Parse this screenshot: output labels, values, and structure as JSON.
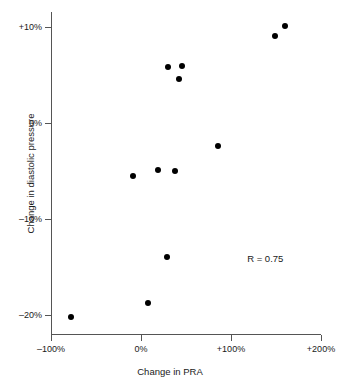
{
  "chart_data": {
    "type": "scatter",
    "title": "",
    "xlabel": "Change in PRA",
    "ylabel": "Change in diastolic pressure",
    "xlim": [
      -100,
      200
    ],
    "ylim": [
      -22.5,
      11.5
    ],
    "grid": false,
    "legend": "none",
    "xticks": [
      {
        "value": -100,
        "label": "–100%"
      },
      {
        "value": 0,
        "label": "0%"
      },
      {
        "value": 100,
        "label": "+100%"
      },
      {
        "value": 200,
        "label": "+200%"
      }
    ],
    "yticks": [
      {
        "value": 10,
        "label": "+10%"
      },
      {
        "value": 0,
        "label": "0%"
      },
      {
        "value": -10,
        "label": "–10%"
      },
      {
        "value": -20,
        "label": "–20%"
      }
    ],
    "points": [
      {
        "x": 160,
        "y": 10.1
      },
      {
        "x": 149,
        "y": 9.1
      },
      {
        "x": 30,
        "y": 5.8
      },
      {
        "x": 45,
        "y": 5.9
      },
      {
        "x": 42,
        "y": 4.6
      },
      {
        "x": 86,
        "y": -2.4
      },
      {
        "x": 19,
        "y": -4.9
      },
      {
        "x": 38,
        "y": -5.0
      },
      {
        "x": -9,
        "y": -5.5
      },
      {
        "x": 29,
        "y": -14.0
      },
      {
        "x": 8,
        "y": -18.8
      },
      {
        "x": -78,
        "y": -20.2
      }
    ],
    "annotations": [
      {
        "text": "R = 0.75",
        "x": 118,
        "y": -14.1
      }
    ],
    "series": [
      {
        "name": "patients",
        "values": [
          10.1,
          9.1,
          5.8,
          5.9,
          4.6,
          -2.4,
          -4.9,
          -5.0,
          -5.5,
          -14.0,
          -18.8,
          -20.2
        ]
      }
    ],
    "colors": {
      "marker": "#000000",
      "axis": "#555555",
      "text": "#1a1a1a",
      "background": "#ffffff"
    }
  }
}
